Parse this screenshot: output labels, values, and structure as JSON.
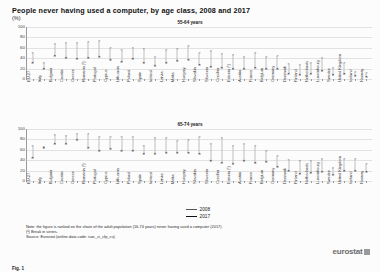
{
  "figure": {
    "title": "People never having used a computer, by age class, 2008 and 2017",
    "unit": "(%)",
    "caption": "Fig. 1",
    "source_logo": "eurostat",
    "notes": [
      "Note: the figure is ranked on the share of the adult population (16-74 years) never having used a computer (2017).",
      "(¹) Break in series.",
      "Source: Eurostat (online data code: isoc_ci_cfp_cu)"
    ],
    "legend": [
      {
        "label": "2008",
        "marker": "×",
        "color": "#5c5c5c"
      },
      {
        "label": "2017",
        "marker": "×",
        "color": "#202020"
      }
    ]
  },
  "chart_data": [
    {
      "type": "scatter",
      "title": "55-64 years",
      "xlabel": "",
      "ylabel": "",
      "ylim": [
        0,
        100
      ],
      "yticks": [
        0,
        20,
        40,
        60,
        80,
        100
      ],
      "grid": true,
      "legend_position": "bottom-center",
      "categories": [
        "EU-27",
        "Italy",
        "Bulgaria",
        "Croatia",
        "Greece",
        "Romania (¹)",
        "Portugal",
        "Cyprus",
        "Lithuania",
        "Poland",
        "Spain",
        "Ireland",
        "Latvia",
        "Malta",
        "Hungary",
        "Slovakia",
        "Slovenia",
        "Czechia",
        "Estonia (¹)",
        "Austria",
        "France",
        "Belgium",
        "Germany",
        "Denmark",
        "Finland",
        "Netherlands",
        "Luxembourg",
        "Sweden",
        "United Kingdom",
        "Iceland",
        "Norway"
      ],
      "series": [
        {
          "name": "2008",
          "values": [
            50,
            30,
            68,
            69,
            69,
            71,
            74,
            60,
            56,
            60,
            57,
            43,
            55,
            57,
            63,
            50,
            53,
            48,
            47,
            43,
            50,
            42,
            45,
            28,
            26,
            30,
            40,
            22,
            30,
            14,
            12
          ]
        },
        {
          "name": "2017",
          "values": [
            30,
            20,
            45,
            40,
            38,
            41,
            42,
            37,
            32,
            38,
            30,
            25,
            30,
            34,
            36,
            27,
            24,
            22,
            20,
            20,
            22,
            20,
            19,
            10,
            8,
            9,
            15,
            7,
            10,
            5,
            4
          ]
        }
      ]
    },
    {
      "type": "scatter",
      "title": "65-74 years",
      "xlabel": "",
      "ylabel": "",
      "ylim": [
        0,
        100
      ],
      "yticks": [
        0,
        20,
        40,
        60,
        80,
        100
      ],
      "grid": true,
      "legend_position": "bottom-center",
      "categories": [
        "EU-27",
        "Italy",
        "Bulgaria",
        "Croatia",
        "Greece",
        "Romania (¹)",
        "Portugal",
        "Cyprus",
        "Lithuania",
        "Poland",
        "Spain",
        "Ireland",
        "Latvia",
        "Malta",
        "Hungary",
        "Slovakia",
        "Slovenia",
        "Czechia",
        "Estonia (¹)",
        "Austria",
        "France",
        "Belgium",
        "Germany",
        "Denmark",
        "Finland",
        "Netherlands",
        "Luxembourg",
        "Sweden",
        "United Kingdom",
        "Iceland",
        "Norway"
      ],
      "series": [
        {
          "name": "2008",
          "values": [
            68,
            66,
            88,
            87,
            90,
            91,
            85,
            84,
            85,
            85,
            67,
            83,
            83,
            76,
            79,
            85,
            72,
            82,
            68,
            72,
            68,
            58,
            48,
            40,
            38,
            38,
            43,
            25,
            42,
            42,
            32
          ]
        },
        {
          "name": "2017",
          "values": [
            44,
            64,
            72,
            72,
            78,
            64,
            58,
            61,
            58,
            57,
            51,
            52,
            53,
            53,
            54,
            52,
            38,
            34,
            32,
            38,
            35,
            37,
            26,
            20,
            14,
            16,
            18,
            12,
            20,
            19,
            18
          ]
        }
      ]
    }
  ]
}
